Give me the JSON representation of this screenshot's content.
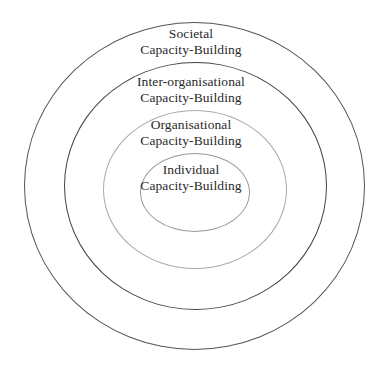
{
  "diagram": {
    "type": "concentric-ellipses",
    "rings": [
      {
        "id": "societal",
        "line1": "Societal",
        "line2": "Capacity-Building",
        "stroke": "#555555"
      },
      {
        "id": "inter-organisational",
        "line1": "Inter-organisational",
        "line2": "Capacity-Building",
        "stroke": "#444444"
      },
      {
        "id": "organisational",
        "line1": "Organisational",
        "line2": "Capacity-Building",
        "stroke": "#aaaaaa"
      },
      {
        "id": "individual",
        "line1": "Individual",
        "line2": "Capacity-Building",
        "stroke": "#999999"
      }
    ]
  }
}
